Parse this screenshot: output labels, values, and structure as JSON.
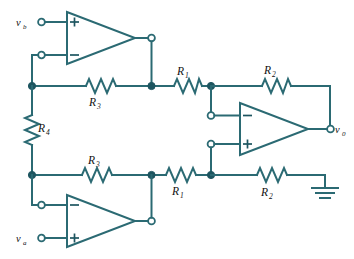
{
  "figure": {
    "kind": "circuit-schematic",
    "colors": {
      "wire": "#2b6a73",
      "node": "#1d5560",
      "label": "#111111",
      "background": "#ffffff"
    }
  },
  "terminals": [
    {
      "id": "vb",
      "base": "v",
      "sub": "b",
      "type": "input-open-terminal"
    },
    {
      "id": "va",
      "base": "v",
      "sub": "a",
      "type": "input-open-terminal"
    },
    {
      "id": "vo",
      "base": "v",
      "sub": "0",
      "type": "output-open-terminal"
    }
  ],
  "resistors": [
    {
      "id": "r3-top",
      "base": "R",
      "sub": "3",
      "orientation": "horizontal"
    },
    {
      "id": "r1-top",
      "base": "R",
      "sub": "1",
      "orientation": "horizontal"
    },
    {
      "id": "r2-top",
      "base": "R",
      "sub": "2",
      "orientation": "horizontal"
    },
    {
      "id": "r4",
      "base": "R",
      "sub": "4",
      "orientation": "vertical"
    },
    {
      "id": "r3-bottom",
      "base": "R",
      "sub": "3",
      "orientation": "horizontal"
    },
    {
      "id": "r1-bottom",
      "base": "R",
      "sub": "1",
      "orientation": "horizontal"
    },
    {
      "id": "r2-bottom",
      "base": "R",
      "sub": "2",
      "orientation": "horizontal"
    }
  ],
  "opamps": [
    {
      "id": "opamp-top",
      "name": "top-left-opamp",
      "input_top": "+",
      "input_bottom": "−"
    },
    {
      "id": "opamp-bottom",
      "name": "bottom-left-opamp",
      "input_top": "−",
      "input_bottom": "+"
    },
    {
      "id": "opamp-right",
      "name": "right-output-opamp",
      "input_top": "−",
      "input_bottom": "+"
    }
  ],
  "ground": {
    "id": "ground-symbol",
    "label": ""
  }
}
